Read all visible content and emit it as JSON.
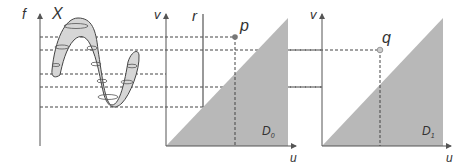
{
  "panels": [
    {
      "id": "signal",
      "axis_label": "f",
      "curve_label": "X"
    },
    {
      "id": "D0",
      "axis_y": "v",
      "axis_x": "u",
      "region_label": "D",
      "region_sub": "0",
      "line_label": "r",
      "point_label": "p"
    },
    {
      "id": "D1",
      "axis_y": "v",
      "axis_x": "u",
      "region_label": "D",
      "region_sub": "1",
      "point_label": "q"
    }
  ],
  "colors": {
    "fill": "#b8b8b8",
    "curve_fill": "#d6d6d6",
    "line": "#555555",
    "point_p": "#777777",
    "point_q": "#cccccc"
  }
}
